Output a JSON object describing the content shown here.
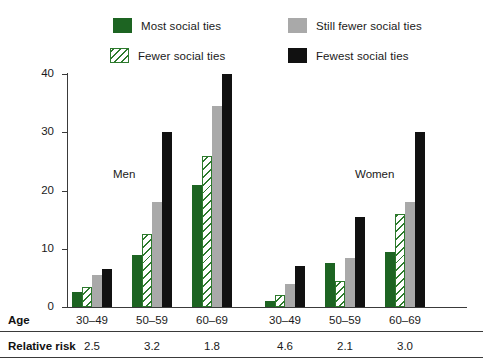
{
  "legend": {
    "items": [
      {
        "label": "Most social ties",
        "icon": "solid-green-swatch",
        "color": "#1d6422"
      },
      {
        "label": "Fewer social ties",
        "icon": "hatched-green-swatch",
        "color": "#2d7a2d"
      },
      {
        "label": "Still fewer social ties",
        "icon": "solid-gray-swatch",
        "color": "#a9a9a9"
      },
      {
        "label": "Fewest social ties",
        "icon": "solid-black-swatch",
        "color": "#111111"
      }
    ]
  },
  "axes": {
    "y_title": "Percentage dying from all causes",
    "y_ticks": [
      "0",
      "10",
      "20",
      "30",
      "40"
    ]
  },
  "group_labels": {
    "men": "Men",
    "women": "Women"
  },
  "rows": {
    "age_label": "Age",
    "relative_risk_label": "Relative risk",
    "age_values": [
      "30–49",
      "50–59",
      "60–69",
      "30–49",
      "50–59",
      "60–69"
    ],
    "relative_risk_values": [
      "2.5",
      "3.2",
      "1.8",
      "4.6",
      "2.1",
      "3.0"
    ]
  },
  "chart_data": {
    "type": "bar",
    "title": "",
    "xlabel": "Age",
    "ylabel": "Percentage dying from all causes",
    "ylim": [
      0,
      40
    ],
    "yticks": [
      0,
      10,
      20,
      30,
      40
    ],
    "grid": false,
    "legend_position": "top",
    "categories": [
      "Men 30–49",
      "Men 50–59",
      "Men 60–69",
      "Women 30–49",
      "Women 50–59",
      "Women 60–69"
    ],
    "series": [
      {
        "name": "Most social ties",
        "values": [
          2.5,
          9.0,
          21.0,
          1.0,
          7.5,
          9.5
        ]
      },
      {
        "name": "Fewer social ties",
        "values": [
          3.5,
          12.5,
          26.0,
          2.0,
          4.5,
          16.0
        ]
      },
      {
        "name": "Still fewer social ties",
        "values": [
          5.5,
          18.0,
          34.5,
          4.0,
          8.5,
          18.0
        ]
      },
      {
        "name": "Fewest social ties",
        "values": [
          6.5,
          30.0,
          40.0,
          7.0,
          15.5,
          30.0
        ]
      }
    ],
    "annotations": [
      {
        "text": "Men",
        "x": "Men 50–59",
        "y": 17.5
      },
      {
        "text": "Women",
        "x": "Women 50–59",
        "y": 17.5
      }
    ],
    "relative_risk": [
      2.5,
      3.2,
      1.8,
      4.6,
      2.1,
      3.0
    ]
  }
}
